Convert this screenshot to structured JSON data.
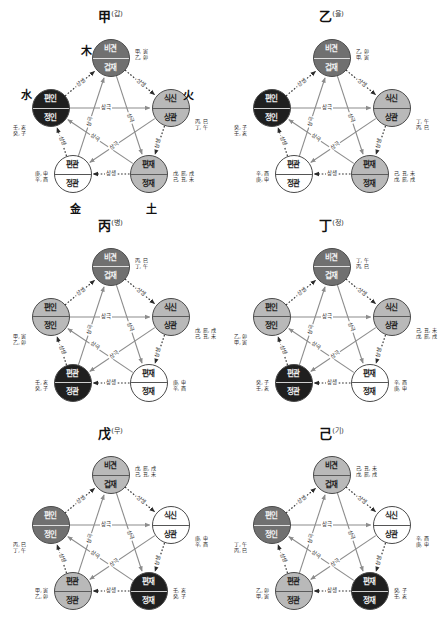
{
  "figure": {
    "title_note": "",
    "relations": {
      "saengsaeng": "상생",
      "sanggeuk": "상극"
    },
    "node_names": {
      "bigyeon": "비견",
      "gyeopjae": "겁재",
      "siksin": "식신",
      "sanggwan": "상관",
      "pyeonjae": "편재",
      "jeongjae": "정재",
      "pyeongwan": "편관",
      "jeonggwan": "정관",
      "pyeonin": "편인",
      "jeongin": "정인"
    },
    "elements": {
      "wood": "木",
      "fire": "火",
      "earth": "土",
      "metal": "金",
      "water": "水"
    }
  },
  "panels": [
    {
      "id": "panel-gap",
      "stem": "甲",
      "reading": "(갑)",
      "show_elements": true,
      "elements": {
        "top": "木",
        "left": "水",
        "right": "火",
        "bottom_left": "金",
        "bottom_right": "土"
      },
      "nodes": {
        "top": {
          "label_top": "비견",
          "label_bottom": "겁재",
          "tone": "tone-mid"
        },
        "right": {
          "label_top": "식신",
          "label_bottom": "상관",
          "tone": "tone-light"
        },
        "bottom_right": {
          "label_top": "편재",
          "label_bottom": "정재",
          "tone": "tone-light"
        },
        "bottom_left": {
          "label_top": "편관",
          "label_bottom": "정관",
          "tone": "tone-white"
        },
        "left": {
          "label_top": "편인",
          "label_bottom": "정인",
          "tone": "tone-dark"
        }
      },
      "annotations": {
        "top": [
          "甲, 寅",
          "乙, 卯"
        ],
        "right": [
          "丙, 巳",
          "丁, 午"
        ],
        "bottom_right": [
          "戊, 辰, 戌",
          "己, 丑, 未"
        ],
        "bottom_left": [
          "庚, 申",
          "辛, 酉"
        ],
        "left": [
          "壬, 亥",
          "癸, 子"
        ]
      }
    },
    {
      "id": "panel-eul",
      "stem": "乙",
      "reading": "(을)",
      "show_elements": false,
      "elements": {
        "top": "",
        "left": "",
        "right": "",
        "bottom_left": "",
        "bottom_right": ""
      },
      "nodes": {
        "top": {
          "label_top": "비견",
          "label_bottom": "겁재",
          "tone": "tone-mid"
        },
        "right": {
          "label_top": "식신",
          "label_bottom": "상관",
          "tone": "tone-light"
        },
        "bottom_right": {
          "label_top": "편재",
          "label_bottom": "정재",
          "tone": "tone-light"
        },
        "bottom_left": {
          "label_top": "편관",
          "label_bottom": "정관",
          "tone": "tone-white"
        },
        "left": {
          "label_top": "편인",
          "label_bottom": "정인",
          "tone": "tone-dark"
        }
      },
      "annotations": {
        "top": [
          "乙, 卯",
          "甲, 寅"
        ],
        "right": [
          "丁, 午",
          "丙, 巳"
        ],
        "bottom_right": [
          "己, 丑, 未",
          "戊, 辰, 戌"
        ],
        "bottom_left": [
          "辛, 酉",
          "庚, 申"
        ],
        "left": [
          "癸, 子",
          "壬, 亥"
        ]
      }
    },
    {
      "id": "panel-byeong",
      "stem": "丙",
      "reading": "(병)",
      "show_elements": false,
      "elements": {
        "top": "",
        "left": "",
        "right": "",
        "bottom_left": "",
        "bottom_right": ""
      },
      "nodes": {
        "top": {
          "label_top": "비견",
          "label_bottom": "겁재",
          "tone": "tone-mid"
        },
        "right": {
          "label_top": "식신",
          "label_bottom": "상관",
          "tone": "tone-light"
        },
        "bottom_right": {
          "label_top": "편재",
          "label_bottom": "정재",
          "tone": "tone-white"
        },
        "bottom_left": {
          "label_top": "편관",
          "label_bottom": "정관",
          "tone": "tone-dark"
        },
        "left": {
          "label_top": "편인",
          "label_bottom": "정인",
          "tone": "tone-light"
        }
      },
      "annotations": {
        "top": [
          "丙, 巳",
          "丁, 午"
        ],
        "right": [
          "戊, 辰, 戌",
          "己, 丑, 未"
        ],
        "bottom_right": [
          "庚, 申",
          "辛, 酉"
        ],
        "bottom_left": [
          "壬, 亥",
          "癸, 子"
        ],
        "left": [
          "甲, 寅",
          "乙, 卯"
        ]
      }
    },
    {
      "id": "panel-jeong",
      "stem": "丁",
      "reading": "(정)",
      "show_elements": false,
      "elements": {
        "top": "",
        "left": "",
        "right": "",
        "bottom_left": "",
        "bottom_right": ""
      },
      "nodes": {
        "top": {
          "label_top": "비견",
          "label_bottom": "겁재",
          "tone": "tone-mid"
        },
        "right": {
          "label_top": "식신",
          "label_bottom": "상관",
          "tone": "tone-light"
        },
        "bottom_right": {
          "label_top": "편재",
          "label_bottom": "정재",
          "tone": "tone-white"
        },
        "bottom_left": {
          "label_top": "편관",
          "label_bottom": "정관",
          "tone": "tone-dark"
        },
        "left": {
          "label_top": "편인",
          "label_bottom": "정인",
          "tone": "tone-light"
        }
      },
      "annotations": {
        "top": [
          "丁, 午",
          "丙, 巳"
        ],
        "right": [
          "己, 丑, 未",
          "戊, 辰, 戌"
        ],
        "bottom_right": [
          "辛, 酉",
          "庚, 申"
        ],
        "bottom_left": [
          "癸, 子",
          "壬, 亥"
        ],
        "left": [
          "乙, 卯",
          "甲, 寅"
        ]
      }
    },
    {
      "id": "panel-mu",
      "stem": "戊",
      "reading": "(무)",
      "show_elements": false,
      "elements": {
        "top": "",
        "left": "",
        "right": "",
        "bottom_left": "",
        "bottom_right": ""
      },
      "nodes": {
        "top": {
          "label_top": "비견",
          "label_bottom": "겁재",
          "tone": "tone-light"
        },
        "right": {
          "label_top": "식신",
          "label_bottom": "상관",
          "tone": "tone-white"
        },
        "bottom_right": {
          "label_top": "편재",
          "label_bottom": "정재",
          "tone": "tone-dark"
        },
        "bottom_left": {
          "label_top": "편관",
          "label_bottom": "정관",
          "tone": "tone-light"
        },
        "left": {
          "label_top": "편인",
          "label_bottom": "정인",
          "tone": "tone-mid"
        }
      },
      "annotations": {
        "top": [
          "戊, 辰, 戌",
          "己, 丑, 未"
        ],
        "right": [
          "庚, 申",
          "辛, 酉"
        ],
        "bottom_right": [
          "壬, 亥",
          "癸, 子"
        ],
        "bottom_left": [
          "甲, 寅",
          "乙, 卯"
        ],
        "left": [
          "丙, 巳",
          "丁, 午"
        ]
      }
    },
    {
      "id": "panel-gi",
      "stem": "己",
      "reading": "(기)",
      "show_elements": false,
      "elements": {
        "top": "",
        "left": "",
        "right": "",
        "bottom_left": "",
        "bottom_right": ""
      },
      "nodes": {
        "top": {
          "label_top": "비견",
          "label_bottom": "겁재",
          "tone": "tone-light"
        },
        "right": {
          "label_top": "식신",
          "label_bottom": "상관",
          "tone": "tone-white"
        },
        "bottom_right": {
          "label_top": "편재",
          "label_bottom": "정재",
          "tone": "tone-dark"
        },
        "bottom_left": {
          "label_top": "편관",
          "label_bottom": "정관",
          "tone": "tone-light"
        },
        "left": {
          "label_top": "편인",
          "label_bottom": "정인",
          "tone": "tone-mid"
        }
      },
      "annotations": {
        "top": [
          "己, 丑, 未",
          "戊, 辰, 戌"
        ],
        "right": [
          "辛, 酉",
          "庚, 申"
        ],
        "bottom_right": [
          "癸, 子",
          "壬, 亥"
        ],
        "bottom_left": [
          "乙, 卯",
          "甲, 寅"
        ],
        "left": [
          "丁, 午",
          "丙, 巳"
        ]
      }
    }
  ],
  "edge_labels": {
    "left_up": "상생",
    "right_down": "상생",
    "bottom": "상생",
    "right_side": "상생",
    "left_side": "상생",
    "horizontal": "상극",
    "d1": "상극",
    "d2": "상극",
    "d3": "상극",
    "d4": "상극"
  },
  "colors": {
    "dark": "#1f1f1f",
    "mid": "#707070",
    "light": "#b9b9b9",
    "white": "#ffffff",
    "line": "#9a9a9a",
    "dotted": "#2b2b2b"
  }
}
